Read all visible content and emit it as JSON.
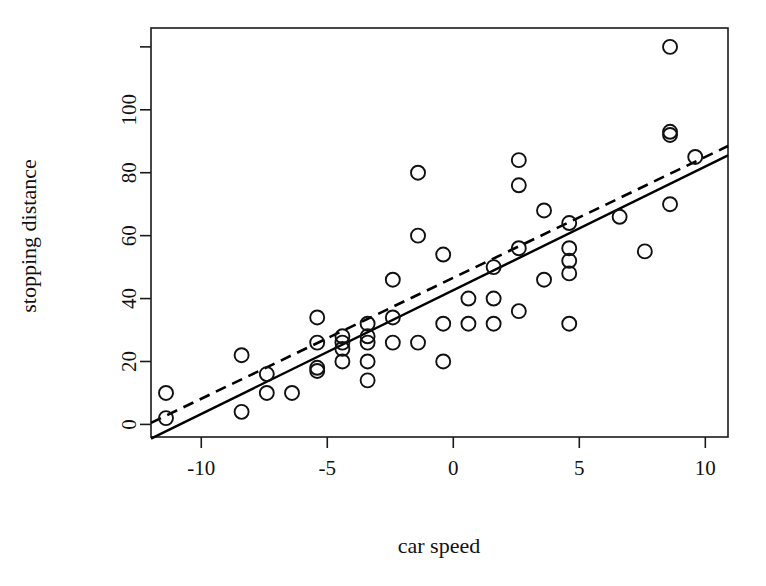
{
  "figure": {
    "background_color": "#ffffff",
    "foreground_color": "#111111",
    "width": 766,
    "height": 586
  },
  "chart_data": {
    "type": "scatter",
    "title": "",
    "subtitle": "",
    "xlabel": "car speed",
    "ylabel": "stopping distance",
    "xlim": [
      -11.995,
      10.9
    ],
    "ylim": [
      -4,
      126
    ],
    "xticks": [
      -10,
      -5,
      0,
      5,
      10
    ],
    "xtick_labels": [
      "-10",
      "-5",
      "0",
      "5",
      "10"
    ],
    "yticks": [
      0,
      20,
      40,
      60,
      80,
      100,
      120
    ],
    "ytick_labels": [
      "0",
      "20",
      "40",
      "60",
      "80",
      "100",
      ""
    ],
    "grid": false,
    "legend": null,
    "legend_position": "none",
    "marker": "open-circle",
    "marker_size": 7,
    "annotations": [],
    "x": [
      -11.4,
      -11.4,
      -8.4,
      -8.4,
      -7.4,
      -7.4,
      -6.4,
      -6.4,
      -6.4,
      -5.4,
      -5.4,
      -5.4,
      -5.4,
      -4.4,
      -4.4,
      -4.4,
      -4.4,
      -3.4,
      -3.4,
      -3.4,
      -3.4,
      -2.4,
      -2.4,
      -2.4,
      -2.4,
      -1.4,
      -1.4,
      -1.4,
      -1.4,
      -0.4,
      -0.4,
      -0.4,
      0.6,
      0.6,
      0.6,
      1.6,
      1.6,
      1.6,
      2.6,
      2.6,
      2.6,
      3.6,
      4.6,
      4.6,
      4.6,
      4.6,
      5.6,
      6.6,
      7.6,
      8.6,
      8.6,
      8.6,
      9.6
    ],
    "y": [
      2,
      10,
      4,
      22,
      16,
      10,
      18,
      26,
      34,
      17,
      28,
      14,
      20,
      24,
      28,
      26,
      34,
      34,
      26,
      20,
      32,
      40,
      32,
      40,
      50,
      42,
      56,
      76,
      84,
      36,
      46,
      68,
      32,
      48,
      52,
      56,
      64,
      66,
      54,
      70,
      93,
      120,
      85,
      0,
      0,
      0,
      0,
      0,
      0,
      0,
      0,
      0,
      0
    ],
    "series": [
      {
        "name": "observations",
        "marker": "open-circle",
        "points": [
          [
            -11.4,
            2
          ],
          [
            -11.4,
            10
          ],
          [
            -8.4,
            4
          ],
          [
            -8.4,
            22
          ],
          [
            -7.4,
            16
          ],
          [
            -7.4,
            10
          ],
          [
            -6.4,
            10
          ],
          [
            -5.4,
            18
          ],
          [
            -5.4,
            26
          ],
          [
            -5.4,
            34
          ],
          [
            -5.4,
            17
          ],
          [
            -4.4,
            26
          ],
          [
            -4.4,
            28
          ],
          [
            -4.4,
            20
          ],
          [
            -4.4,
            24
          ],
          [
            -3.4,
            32
          ],
          [
            -3.4,
            28
          ],
          [
            -3.4,
            20
          ],
          [
            -3.4,
            26
          ],
          [
            -3.4,
            14
          ],
          [
            -2.4,
            34
          ],
          [
            -2.4,
            46
          ],
          [
            -2.4,
            26
          ],
          [
            -1.4,
            80
          ],
          [
            -1.4,
            60
          ],
          [
            -1.4,
            26
          ],
          [
            -0.4,
            54
          ],
          [
            -0.4,
            32
          ],
          [
            -0.4,
            20
          ],
          [
            0.6,
            40
          ],
          [
            0.6,
            32
          ],
          [
            1.6,
            50
          ],
          [
            1.6,
            40
          ],
          [
            1.6,
            32
          ],
          [
            2.6,
            84
          ],
          [
            2.6,
            76
          ],
          [
            2.6,
            56
          ],
          [
            2.6,
            36
          ],
          [
            3.6,
            68
          ],
          [
            3.6,
            46
          ],
          [
            4.6,
            64
          ],
          [
            4.6,
            56
          ],
          [
            4.6,
            52
          ],
          [
            4.6,
            48
          ],
          [
            4.6,
            32
          ],
          [
            6.6,
            66
          ],
          [
            7.6,
            55
          ],
          [
            8.6,
            120
          ],
          [
            8.6,
            93
          ],
          [
            8.6,
            92
          ],
          [
            8.6,
            70
          ],
          [
            9.6,
            85
          ]
        ]
      }
    ],
    "lines": [
      {
        "name": "least-squares-fit",
        "style": "solid",
        "x_start": -11.995,
        "y_start": -4.5,
        "x_end": 10.9,
        "y_end": 85.5
      },
      {
        "name": "robust-fit",
        "style": "dashed",
        "x_start": -11.995,
        "y_start": 0.5,
        "x_end": 10.9,
        "y_end": 88.5
      }
    ]
  },
  "axes": {
    "x_title": "car speed",
    "y_title": "stopping distance"
  }
}
